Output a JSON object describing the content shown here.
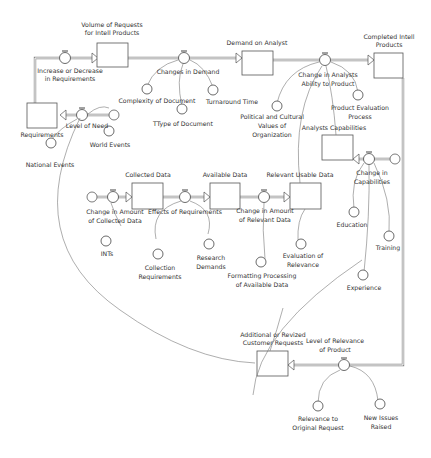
{
  "diagram": {
    "type": "stock-and-flow",
    "stocks": [
      {
        "id": "volume_requests",
        "label": [
          "Volume of Requests",
          "for Intell Products"
        ]
      },
      {
        "id": "demand_analyst",
        "label": [
          "Demand on Analyst"
        ]
      },
      {
        "id": "completed_products",
        "label": [
          "Completed Intell",
          "Products"
        ]
      },
      {
        "id": "requirements",
        "label": [
          "Requirements"
        ]
      },
      {
        "id": "analysts_capabilities",
        "label": [
          "Analysts Capabilities"
        ]
      },
      {
        "id": "collected_data",
        "label": [
          "Collected Data"
        ]
      },
      {
        "id": "available_data",
        "label": [
          "Available Data"
        ]
      },
      {
        "id": "relevant_usable_data",
        "label": [
          "Relevant Usable Data"
        ]
      },
      {
        "id": "additional_requests",
        "label": [
          "Additional or Revized",
          "Customer Requests"
        ]
      }
    ],
    "flows": [
      {
        "id": "increase_decrease",
        "label": [
          "Increase or Decrease",
          "in Requirements"
        ]
      },
      {
        "id": "changes_demand",
        "label": [
          "Changes in Demand"
        ]
      },
      {
        "id": "change_ability",
        "label": [
          "Change in Analysts",
          "Ability to Product"
        ]
      },
      {
        "id": "level_need",
        "label": [
          "Level of Need"
        ]
      },
      {
        "id": "change_capabilities",
        "label": [
          "Change in",
          "Capabilities"
        ]
      },
      {
        "id": "change_collected",
        "label": [
          "Change in Amount",
          "of Collected Data"
        ]
      },
      {
        "id": "effects_requirements",
        "label": [
          "Effects of Requirements"
        ]
      },
      {
        "id": "change_relevant",
        "label": [
          "Change in Amount",
          "of Relevant Data"
        ]
      },
      {
        "id": "level_relevance",
        "label": [
          "Level of Relevance",
          "of Product"
        ]
      }
    ],
    "converters": [
      {
        "id": "complexity",
        "label": [
          "Complexity of Document"
        ]
      },
      {
        "id": "turnaround",
        "label": [
          "Turnaround Time"
        ]
      },
      {
        "id": "type_document",
        "label": [
          "TType of Document"
        ]
      },
      {
        "id": "political",
        "label": [
          "Political and Cultural",
          "Values of",
          "Organization"
        ]
      },
      {
        "id": "product_eval",
        "label": [
          "Product Evaluation",
          "Process"
        ]
      },
      {
        "id": "national_events",
        "label": [
          "National Events"
        ]
      },
      {
        "id": "world_events",
        "label": [
          "World Events"
        ]
      },
      {
        "id": "education",
        "label": [
          "Education"
        ]
      },
      {
        "id": "training",
        "label": [
          "Training"
        ]
      },
      {
        "id": "ints",
        "label": [
          "INTs"
        ]
      },
      {
        "id": "collection_req",
        "label": [
          "Collection",
          "Requirements"
        ]
      },
      {
        "id": "research_demands",
        "label": [
          "Research",
          "Demands"
        ]
      },
      {
        "id": "eval_relevance",
        "label": [
          "Evaluation of",
          "Relevance"
        ]
      },
      {
        "id": "formatting",
        "label": [
          "Formatting Processing",
          "of Available Data"
        ]
      },
      {
        "id": "experience",
        "label": [
          "Experience"
        ]
      },
      {
        "id": "relevance_original",
        "label": [
          "Relevance to",
          "Original Request"
        ]
      },
      {
        "id": "new_issues",
        "label": [
          "New Issues",
          "Raised"
        ]
      }
    ]
  }
}
